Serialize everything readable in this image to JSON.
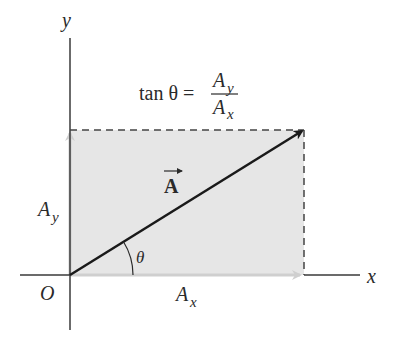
{
  "diagram": {
    "colors": {
      "axis": "#3a3a3a",
      "shade": "#e6e6e6",
      "dashed": "#444444",
      "vector": "#1a1a1a",
      "component_arrow": "#cfcfcf",
      "text": "#2a2a2a"
    },
    "labels": {
      "y_axis": "y",
      "x_axis": "x",
      "origin": "O",
      "vector": "A",
      "theta": "θ",
      "ay_main": "A",
      "ay_sub": "y",
      "ax_main": "A",
      "ax_sub": "x"
    },
    "equation": {
      "lhs": "tan θ =",
      "numerator_main": "A",
      "numerator_sub": "y",
      "denominator_main": "A",
      "denominator_sub": "x"
    }
  }
}
